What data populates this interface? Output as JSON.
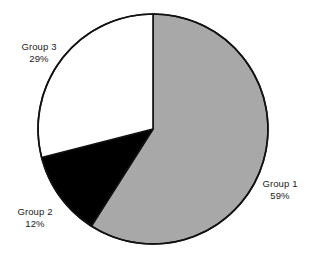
{
  "chart_data": {
    "type": "pie",
    "title": "",
    "subtitle": "",
    "xlabel": "",
    "ylabel": "",
    "legend_position": "none",
    "grid": false,
    "start_angle_deg": 0,
    "direction": "clockwise",
    "categories": [
      "Group 1",
      "Group 2",
      "Group 3"
    ],
    "values": [
      59,
      12,
      29
    ],
    "value_unit": "%",
    "slices": [
      {
        "label": "Group 1",
        "value": 59,
        "value_text": "59%",
        "color": "#a8a8a8",
        "start_deg": 0,
        "end_deg": 212.4
      },
      {
        "label": "Group 2",
        "value": 12,
        "value_text": "12%",
        "color": "#000000",
        "start_deg": 212.4,
        "end_deg": 255.6
      },
      {
        "label": "Group 3",
        "value": 29,
        "value_text": "29%",
        "color": "#ffffff",
        "start_deg": 255.6,
        "end_deg": 360
      }
    ],
    "annotations": [
      {
        "text": "Group 1",
        "value_text": "59%",
        "placement": "right"
      },
      {
        "text": "Group 2",
        "value_text": "12%",
        "placement": "bottom-left"
      },
      {
        "text": "Group 3",
        "value_text": "29%",
        "placement": "top-left"
      }
    ]
  },
  "style": {
    "background": "#ffffff",
    "outline_color": "#111111",
    "label_color": "#1a1a1a",
    "slice_1_color": "#a8a8a8",
    "slice_2_color": "#000000",
    "slice_3_color": "#ffffff"
  }
}
